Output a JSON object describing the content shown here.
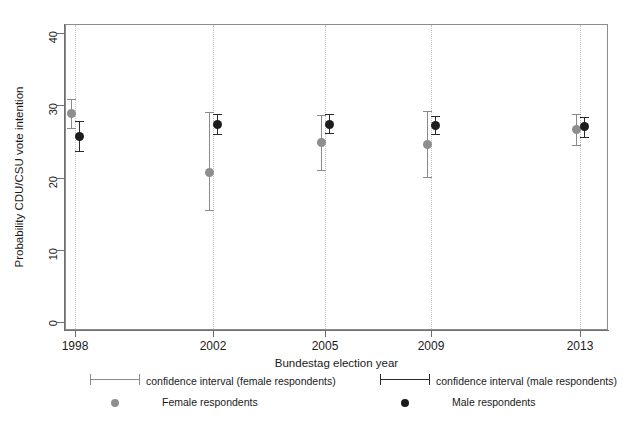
{
  "chart_data": {
    "type": "scatter",
    "title": "",
    "xlabel": "Bundestag election year",
    "ylabel": "Probability CDU/CSU vote intention",
    "categories": [
      "1998",
      "2002",
      "2005",
      "2009",
      "2013"
    ],
    "xtick_labels": [
      "1998",
      "2002",
      "2005",
      "2009",
      "2013"
    ],
    "ytick_labels": [
      "0",
      "10",
      "20",
      "30",
      "40"
    ],
    "ylim": [
      0,
      41
    ],
    "yticks": [
      0,
      10,
      20,
      30,
      40
    ],
    "grid": "vertical dotted gridlines at each election year",
    "legend_position": "below plot, two columns",
    "series": [
      {
        "name": "Female respondents",
        "color": "#8e8e8e",
        "marker": "filled circle (grey)",
        "values": [
          28.8,
          20.7,
          24.8,
          24.5,
          26.6
        ],
        "ci_low": [
          26.8,
          15.5,
          21.0,
          20.1,
          24.5
        ],
        "ci_high": [
          30.8,
          29.0,
          28.6,
          29.2,
          28.8
        ]
      },
      {
        "name": "Male respondents",
        "color": "#1c1c1c",
        "marker": "filled circle (black)",
        "values": [
          25.7,
          27.4,
          27.4,
          27.2,
          27.0
        ],
        "ci_low": [
          23.6,
          26.0,
          26.1,
          26.0,
          25.6
        ],
        "ci_high": [
          27.8,
          28.8,
          28.8,
          28.5,
          28.4
        ]
      }
    ]
  },
  "legend": {
    "ci_female_label": "confidence interval (female respondents)",
    "ci_male_label": "confidence interval (male respondents)",
    "point_female_label": "Female respondents",
    "point_male_label": "Male respondents"
  },
  "colors": {
    "female": "#8e8e8e",
    "male": "#1c1c1c",
    "axis": "#6f6f6f",
    "grid": "#c2c2c2",
    "background": "#ffffff"
  }
}
